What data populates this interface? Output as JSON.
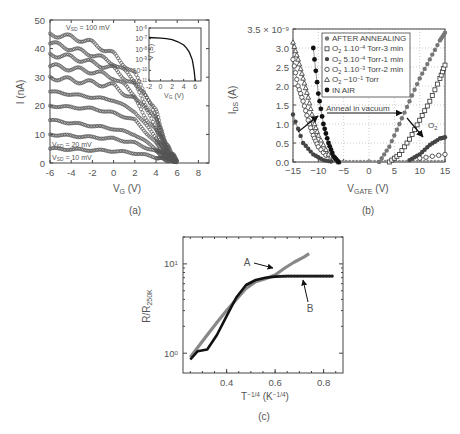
{
  "chart_data": [
    {
      "id": "a",
      "type": "scatter",
      "panel_label": "(a)",
      "xlabel": "V_G (V)",
      "ylabel": "I (nA)",
      "xlim": [
        -6,
        9
      ],
      "ylim": [
        0,
        50
      ],
      "xticks": [
        -6,
        -4,
        -2,
        0,
        2,
        4,
        6,
        8
      ],
      "yticks": [
        0,
        10,
        20,
        30,
        40,
        50
      ],
      "annotations": [
        "V_SD = 100 mV",
        "V_SD = 20 mV",
        "V_SD = 10 mV"
      ],
      "series": [
        {
          "name": "V_SD = 10 mV",
          "x": [
            -6,
            -4,
            -2,
            0,
            2,
            4,
            5,
            6
          ],
          "y": [
            5,
            4.8,
            4.5,
            4.2,
            3.5,
            2,
            1,
            0.3
          ]
        },
        {
          "name": "V_SD = 20 mV",
          "x": [
            -6,
            -4,
            -2,
            0,
            2,
            4,
            5,
            6
          ],
          "y": [
            10,
            9.5,
            9,
            8.5,
            7,
            4,
            1.5,
            0.3
          ]
        },
        {
          "name": "V_SD = 30 mV",
          "x": [
            -6,
            -4,
            -2,
            0,
            2,
            4,
            5,
            6
          ],
          "y": [
            15,
            14,
            13,
            12,
            10,
            5,
            2,
            0.3
          ]
        },
        {
          "name": "V_SD = 40 mV",
          "x": [
            -6,
            -4,
            -2,
            0,
            2,
            4,
            5,
            6
          ],
          "y": [
            20,
            19.5,
            19,
            17.5,
            15,
            7,
            2.5,
            0.4
          ]
        },
        {
          "name": "V_SD = 50 mV",
          "x": [
            -6,
            -4,
            -2,
            0,
            2,
            4,
            5,
            6
          ],
          "y": [
            25,
            24,
            23,
            22,
            18,
            9,
            3,
            0.5
          ]
        },
        {
          "name": "V_SD = 60 mV",
          "x": [
            -6,
            -4,
            -2,
            0,
            2,
            4,
            5,
            6
          ],
          "y": [
            30,
            29,
            28,
            27,
            22,
            11,
            3.5,
            0.5
          ]
        },
        {
          "name": "V_SD = 70 mV",
          "x": [
            -6,
            -4,
            -2,
            0,
            2,
            4,
            5,
            6
          ],
          "y": [
            34,
            33,
            32,
            30,
            24,
            13,
            4,
            0.6
          ]
        },
        {
          "name": "V_SD = 80 mV",
          "x": [
            -6,
            -4,
            -2,
            0,
            2,
            4,
            5,
            6
          ],
          "y": [
            38,
            37,
            35,
            33,
            27,
            15,
            5,
            0.6
          ]
        },
        {
          "name": "V_SD = 90 mV",
          "x": [
            -6,
            -4,
            -2,
            0,
            2,
            4,
            5,
            6
          ],
          "y": [
            42,
            40,
            38,
            35,
            29,
            17,
            5,
            0.7
          ]
        },
        {
          "name": "V_SD = 100 mV",
          "x": [
            -6,
            -4,
            -2,
            0,
            2,
            4,
            5,
            6
          ],
          "y": [
            45,
            44,
            42,
            38,
            31,
            18,
            6,
            0.7
          ]
        }
      ],
      "inset": {
        "type": "line",
        "xlabel": "V_G (V)",
        "ylabel": "V (S)",
        "xlim": [
          -2,
          7
        ],
        "ylim_exp": [
          -11,
          -6
        ],
        "xticks": [
          -2,
          0,
          2,
          4,
          6
        ],
        "yticks": [
          "10^-6",
          "10^-7",
          "10^-8",
          "10^-9",
          "10^-10",
          "10^-11"
        ],
        "x": [
          -2,
          0,
          1,
          2,
          3,
          4,
          4.5,
          5,
          5.5,
          5.8,
          6
        ],
        "y_log10": [
          -6.9,
          -6.95,
          -7.0,
          -7.1,
          -7.3,
          -7.6,
          -7.9,
          -8.3,
          -9.0,
          -10.0,
          -11.0
        ]
      }
    },
    {
      "id": "b",
      "type": "scatter",
      "panel_label": "(b)",
      "xlabel": "V_GATE (V)",
      "ylabel": "I_DS (A)",
      "xlim": [
        -15,
        15
      ],
      "ylim": [
        0,
        3.5e-09
      ],
      "y_scale_label": "3.5 × 10^-9",
      "xticks": [
        -15,
        -10,
        -5,
        0,
        5,
        10,
        15
      ],
      "yticks": [
        0.0,
        0.5,
        1.0,
        1.5,
        2.0,
        2.5,
        3.0,
        3.5
      ],
      "legend_position": "upper center",
      "annotations": [
        "Anneal in vacuum",
        "O2"
      ],
      "series": [
        {
          "name": "AFTER ANNEALING",
          "marker": "filled-circle-gray",
          "x": [
            2,
            4,
            6,
            8,
            10,
            12,
            14,
            15
          ],
          "y": [
            0.0,
            0.4,
            1.0,
            1.6,
            2.2,
            2.7,
            3.2,
            3.4
          ]
        },
        {
          "name": "O2 1.10^-4 Torr-3 min",
          "marker": "square-open",
          "x": [
            4,
            6,
            8,
            10,
            12,
            14,
            15
          ],
          "y": [
            0.0,
            0.2,
            0.6,
            1.1,
            1.6,
            2.2,
            2.55
          ]
        },
        {
          "name": "O2 5.10^-4 Torr-1 min",
          "marker": "filled-circle-dark",
          "x": [
            -15,
            -13,
            -11,
            -9,
            -7,
            8,
            10,
            12,
            14,
            15
          ],
          "y": [
            1.25,
            0.5,
            0.2,
            0.05,
            0.0,
            0.05,
            0.2,
            0.45,
            0.62,
            0.65
          ]
        },
        {
          "name": "O2 1.10^-3 Torr-2 min",
          "marker": "circle-open",
          "x": [
            -15,
            -14,
            -13,
            -12,
            -11,
            -10,
            -8,
            10,
            15
          ],
          "y": [
            2.7,
            2.0,
            1.6,
            1.1,
            0.7,
            0.4,
            0.1,
            0.1,
            0.2
          ]
        },
        {
          "name": "O2 ~10^-1 Torr",
          "marker": "triangle-open",
          "x": [
            -15,
            -14,
            -13,
            -12,
            -11,
            -10,
            -8,
            -6
          ],
          "y": [
            3.15,
            2.7,
            2.2,
            1.7,
            1.1,
            0.7,
            0.2,
            0.0
          ]
        },
        {
          "name": "IN AIR",
          "marker": "filled-circle-black",
          "x": [
            -11,
            -10,
            -9,
            -8,
            -7,
            -6
          ],
          "y": [
            3.0,
            1.8,
            1.0,
            0.5,
            0.15,
            0.0
          ]
        }
      ]
    },
    {
      "id": "c",
      "type": "line",
      "panel_label": "(c)",
      "xlabel": "T^-1/4 (K^-1/4)",
      "ylabel": "R/R_250K",
      "xlim": [
        0.22,
        0.88
      ],
      "ylim_log": [
        0.6,
        20
      ],
      "xticks": [
        0.4,
        0.6,
        0.8
      ],
      "yticks": [
        "10^0",
        "10^1"
      ],
      "annotations": [
        "A",
        "B"
      ],
      "series": [
        {
          "name": "A",
          "color": "#888888",
          "x": [
            0.25,
            0.28,
            0.32,
            0.36,
            0.4,
            0.44,
            0.48,
            0.52,
            0.56,
            0.6,
            0.64,
            0.68,
            0.72,
            0.74
          ],
          "y": [
            0.9,
            1.15,
            1.6,
            2.2,
            3.0,
            4.0,
            5.3,
            6.3,
            6.8,
            7.5,
            9.0,
            10.5,
            12.0,
            13.0
          ]
        },
        {
          "name": "B",
          "color": "#111111",
          "x": [
            0.25,
            0.28,
            0.32,
            0.36,
            0.4,
            0.44,
            0.48,
            0.52,
            0.56,
            0.6,
            0.65,
            0.7,
            0.75,
            0.8,
            0.84
          ],
          "y": [
            0.85,
            1.05,
            1.1,
            1.6,
            2.6,
            4.2,
            5.8,
            6.6,
            7.0,
            7.2,
            7.3,
            7.3,
            7.3,
            7.3,
            7.3
          ]
        }
      ]
    }
  ]
}
